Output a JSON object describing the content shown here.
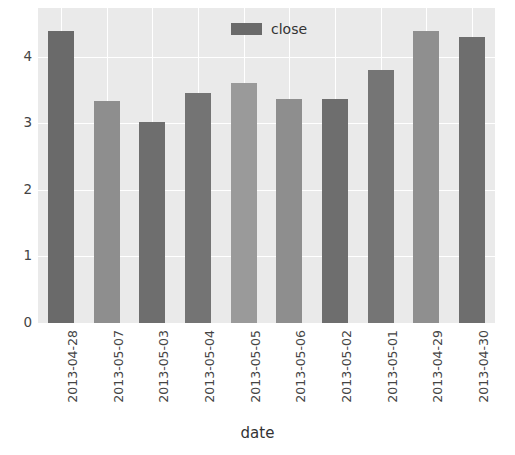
{
  "chart_data": {
    "type": "bar",
    "title": "",
    "xlabel": "date",
    "ylabel": "",
    "categories": [
      "2013-04-28",
      "2013-05-07",
      "2013-05-03",
      "2013-05-04",
      "2013-05-05",
      "2013-05-06",
      "2013-05-02",
      "2013-05-01",
      "2013-04-29",
      "2013-04-30"
    ],
    "values": [
      4.39,
      3.34,
      3.02,
      3.46,
      3.61,
      3.37,
      3.37,
      3.8,
      4.38,
      4.3
    ],
    "bar_colors": [
      "#6a6a6a",
      "#8e8e8e",
      "#6e6e6e",
      "#747474",
      "#9a9a9a",
      "#8e8e8e",
      "#6e6e6e",
      "#757575",
      "#8f8f8f",
      "#6e6e6e"
    ],
    "series": [
      {
        "name": "close",
        "values": [
          4.39,
          3.34,
          3.02,
          3.46,
          3.61,
          3.37,
          3.37,
          3.8,
          4.38,
          4.3
        ]
      }
    ],
    "yticks": [
      0,
      1,
      2,
      3,
      4
    ],
    "ytick_labels": [
      "0",
      "1",
      "2",
      "3",
      "4"
    ],
    "ylim": [
      0,
      4.73
    ],
    "grid": true,
    "legend": {
      "label": "close",
      "swatch_color": "#6a6a6a",
      "position": "top-center"
    },
    "style": {
      "axes_facecolor": "#eaeaea",
      "figure_facecolor": "#ffffff",
      "gridline_color": "#ffffff",
      "tick_label_color": "#444444"
    }
  }
}
